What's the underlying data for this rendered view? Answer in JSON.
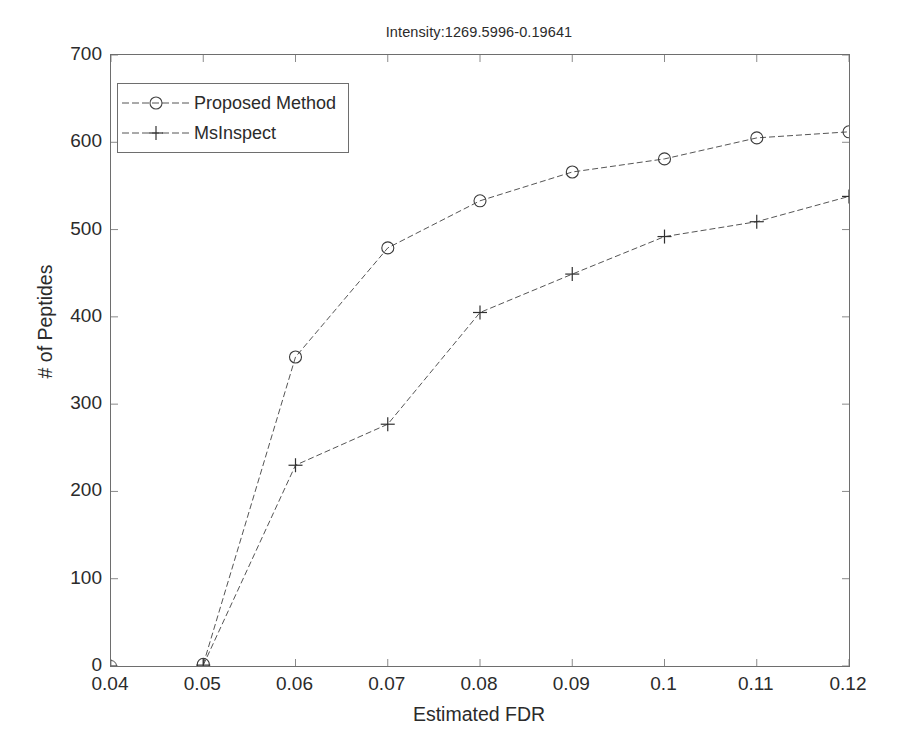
{
  "chart_data": {
    "type": "line",
    "title": "Intensity:1269.5996-0.19641",
    "xlabel": "Estimated FDR",
    "ylabel": "# of Peptides",
    "xlim": [
      0.04,
      0.12
    ],
    "ylim": [
      0,
      700
    ],
    "xticks": [
      0.04,
      0.05,
      0.06,
      0.07,
      0.08,
      0.09,
      0.1,
      0.11,
      0.12
    ],
    "xtick_labels": [
      "0.04",
      "0.05",
      "0.06",
      "0.07",
      "0.08",
      "0.09",
      "0.1",
      "0.11",
      "0.12"
    ],
    "yticks": [
      0,
      100,
      200,
      300,
      400,
      500,
      600,
      700
    ],
    "ytick_labels": [
      "0",
      "100",
      "200",
      "300",
      "400",
      "500",
      "600",
      "700"
    ],
    "grid": false,
    "legend_position": "upper left",
    "x": [
      0.04,
      0.05,
      0.06,
      0.07,
      0.08,
      0.09,
      0.1,
      0.11,
      0.12
    ],
    "series": [
      {
        "name": "Proposed Method",
        "marker": "circle",
        "color": "#333333",
        "x": [
          0.05,
          0.06,
          0.07,
          0.08,
          0.09,
          0.1,
          0.11,
          0.12
        ],
        "values": [
          2,
          354,
          479,
          533,
          566,
          581,
          605,
          612
        ]
      },
      {
        "name": "MsInspect",
        "marker": "plus",
        "color": "#333333",
        "x": [
          0.05,
          0.06,
          0.07,
          0.08,
          0.09,
          0.1,
          0.11,
          0.12
        ],
        "values": [
          1,
          230,
          277,
          405,
          449,
          492,
          509,
          538
        ]
      }
    ],
    "origin_marker": {
      "x": 0.04,
      "y": 0
    }
  },
  "legend": {
    "items": [
      {
        "label": "Proposed Method",
        "marker": "circle"
      },
      {
        "label": "MsInspect",
        "marker": "plus"
      }
    ]
  },
  "colors": {
    "axis": "#6e6e6e",
    "line": "#555555",
    "text": "#2b2b2b",
    "background": "#ffffff"
  }
}
